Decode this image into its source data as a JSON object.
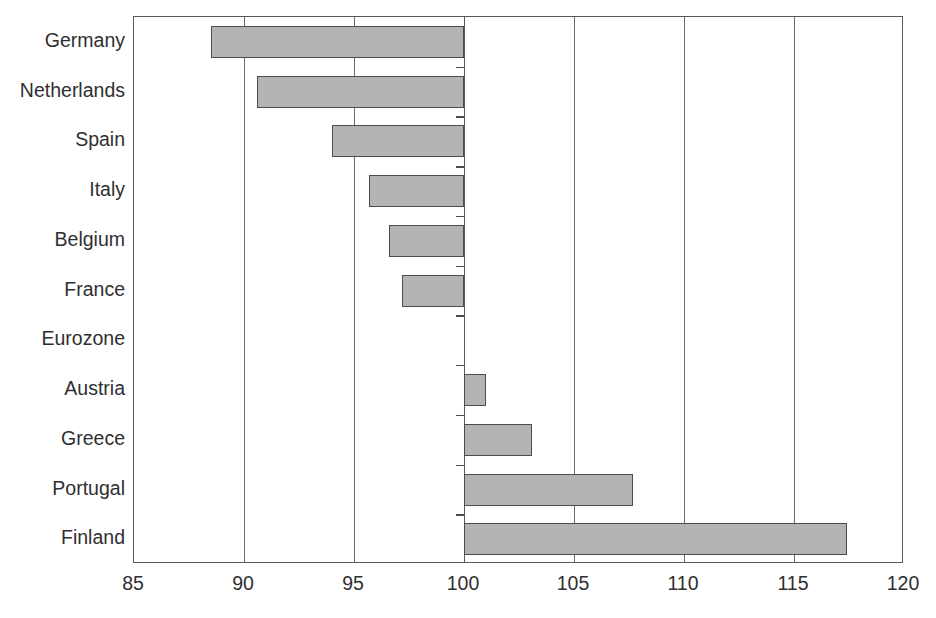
{
  "chart_data": {
    "type": "bar",
    "orientation": "horizontal",
    "title": "",
    "subtitle": "",
    "xlabel": "",
    "ylabel": "",
    "xlim": [
      85,
      120
    ],
    "xticks": [
      85,
      90,
      95,
      100,
      105,
      110,
      115,
      120
    ],
    "xtick_labels": [
      "85",
      "90",
      "95",
      "100",
      "105",
      "110",
      "115",
      "120"
    ],
    "baseline": 100,
    "grid": "vertical",
    "legend": "none",
    "categories": [
      "Germany",
      "Netherlands",
      "Spain",
      "Italy",
      "Belgium",
      "France",
      "Eurozone",
      "Austria",
      "Greece",
      "Portugal",
      "Finland"
    ],
    "values": [
      88.5,
      90.6,
      94.0,
      95.7,
      96.6,
      97.2,
      100.0,
      101.0,
      103.1,
      107.7,
      117.4
    ],
    "series": [
      {
        "name": "Index",
        "values": [
          88.5,
          90.6,
          94.0,
          95.7,
          96.6,
          97.2,
          100.0,
          101.0,
          103.1,
          107.7,
          117.4
        ]
      }
    ]
  },
  "style": {
    "bar_fill": "#b4b4b4",
    "bar_stroke": "#4c4c4e",
    "axis_color": "#59595b",
    "grid_color": "#6c6c6e",
    "text_color": "#2f2f31",
    "background": "#ffffff"
  }
}
